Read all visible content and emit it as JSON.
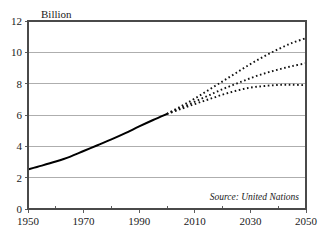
{
  "chart_data": {
    "type": "line",
    "title": "",
    "subtitle": "",
    "xlabel": "",
    "ylabel": "Billion",
    "unit_label": "Billion",
    "xlim": [
      1950,
      2050
    ],
    "ylim": [
      0,
      12
    ],
    "grid": true,
    "grid_axis": "y",
    "legend": false,
    "legend_position": "none",
    "annotations": [
      {
        "name": "source-note",
        "text": "Source: United Nations",
        "x": 2046,
        "y": 0.6,
        "style": "italic"
      }
    ],
    "y_ticks": [
      0,
      2,
      4,
      6,
      8,
      10,
      12
    ],
    "y_tick_labels": [
      "0",
      "2",
      "4",
      "6",
      "8",
      "10",
      "12"
    ],
    "x_ticks": [
      1950,
      1970,
      1990,
      2010,
      2030,
      2050
    ],
    "x_tick_labels": [
      "1950",
      "1970",
      "1990",
      "2010",
      "2030",
      "2050"
    ],
    "x_minor_ticks": [
      1960,
      1980,
      2000,
      2020,
      2040
    ],
    "series": [
      {
        "name": "Historical estimate",
        "style": "solid",
        "color": "#000000",
        "x": [
          1950,
          1955,
          1960,
          1965,
          1970,
          1975,
          1980,
          1985,
          1990,
          1995,
          2000
        ],
        "values": [
          2.53,
          2.77,
          3.03,
          3.33,
          3.7,
          4.07,
          4.44,
          4.84,
          5.27,
          5.68,
          6.07
        ]
      },
      {
        "name": "High projection",
        "style": "dotted",
        "color": "#111111",
        "x": [
          2000,
          2005,
          2010,
          2015,
          2020,
          2025,
          2030,
          2035,
          2040,
          2045,
          2050
        ],
        "values": [
          6.07,
          6.55,
          7.05,
          7.6,
          8.15,
          8.7,
          9.25,
          9.75,
          10.2,
          10.6,
          10.9
        ]
      },
      {
        "name": "Medium projection",
        "style": "dotted",
        "color": "#111111",
        "x": [
          2000,
          2005,
          2010,
          2015,
          2020,
          2025,
          2030,
          2035,
          2040,
          2045,
          2050
        ],
        "values": [
          6.07,
          6.45,
          6.85,
          7.25,
          7.65,
          8.0,
          8.35,
          8.65,
          8.9,
          9.12,
          9.3
        ]
      },
      {
        "name": "Low projection",
        "style": "dotted",
        "color": "#111111",
        "x": [
          2000,
          2005,
          2010,
          2015,
          2020,
          2025,
          2030,
          2035,
          2040,
          2045,
          2050
        ],
        "values": [
          6.07,
          6.38,
          6.7,
          7.0,
          7.3,
          7.55,
          7.75,
          7.85,
          7.92,
          7.93,
          7.9
        ]
      }
    ]
  },
  "colors": {
    "background": "#ffffff",
    "axis": "#4a4a4a",
    "grid": "#9a9a9a",
    "series": "#000000",
    "text": "#1a1a1a"
  }
}
